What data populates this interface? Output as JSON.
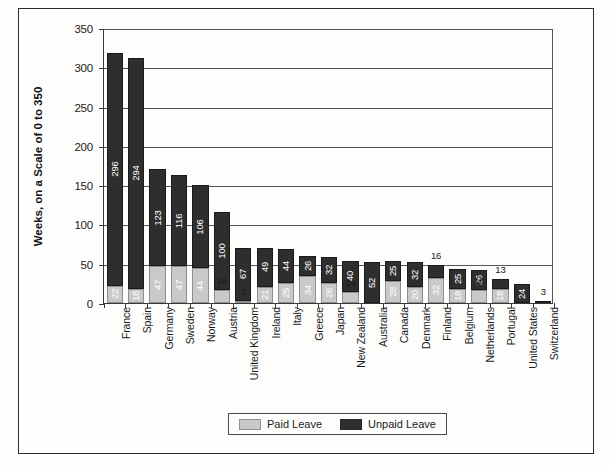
{
  "chart_data": {
    "type": "bar",
    "subtype": "stacked-vertical",
    "title": "",
    "xlabel": "",
    "ylabel": "Weeks, on a Scale of 0 to 350",
    "ylim": [
      0,
      350
    ],
    "ytick_step": 50,
    "ytick_labels": [
      "0",
      "50",
      "100",
      "150",
      "200",
      "250",
      "300",
      "350"
    ],
    "grid": true,
    "grid_axis": "y",
    "legend_position": "bottom-center",
    "categories": [
      "France",
      "Spain",
      "Germany",
      "Sweden",
      "Norway",
      "Austria",
      "United Kingdom",
      "Ireland",
      "Italy",
      "Greece",
      "Japan",
      "New Zealand",
      "Australia",
      "Canada",
      "Denmark",
      "Finland",
      "Belgium",
      "Netherlands",
      "Portugal",
      "United States",
      "Switzerland"
    ],
    "series": [
      {
        "name": "Paid Leave",
        "color": "#c9c9c9",
        "values": [
          22,
          18,
          47,
          47,
          44,
          16,
          3,
          21,
          25,
          34,
          26,
          14,
          0,
          28,
          20,
          32,
          18,
          16,
          18,
          0,
          0
        ]
      },
      {
        "name": "Unpaid Leave",
        "color": "#2e2e2e",
        "values": [
          296,
          294,
          123,
          116,
          106,
          100,
          67,
          49,
          44,
          26,
          32,
          40,
          52,
          25,
          32,
          16,
          25,
          26,
          13,
          24,
          3
        ]
      }
    ],
    "totals": [
      318,
      312,
      170,
      163,
      150,
      116,
      70,
      70,
      69,
      60,
      58,
      54,
      52,
      53,
      52,
      48,
      43,
      42,
      31,
      24,
      3
    ]
  },
  "legend": {
    "items": [
      {
        "label": "Paid Leave",
        "swatch": "paid-leave-swatch"
      },
      {
        "label": "Unpaid Leave",
        "swatch": "unpaid-leave-swatch"
      }
    ]
  }
}
